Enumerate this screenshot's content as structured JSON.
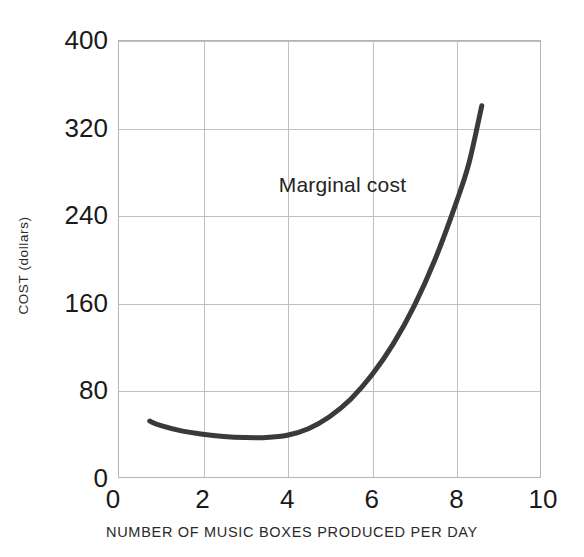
{
  "chart_data": {
    "type": "line",
    "title": "",
    "xlabel": "NUMBER OF MUSIC BOXES PRODUCED PER DAY",
    "ylabel": "COST (dollars)",
    "xlim": [
      0,
      10
    ],
    "ylim": [
      0,
      400
    ],
    "grid": true,
    "legend": "none",
    "xticks": [
      "0",
      "2",
      "4",
      "6",
      "8",
      "10"
    ],
    "xtick_values": [
      0,
      2,
      4,
      6,
      8,
      10
    ],
    "yticks": [
      "0",
      "80",
      "160",
      "240",
      "320",
      "400"
    ],
    "ytick_values": [
      0,
      80,
      160,
      240,
      320,
      400
    ],
    "annotations": [
      {
        "text": "Marginal cost",
        "x": 5.3,
        "y": 268
      }
    ],
    "series": [
      {
        "name": "Marginal cost",
        "color": "#3a3a3a",
        "linewidth": 5,
        "x": [
          0.75,
          1.0,
          1.5,
          2.0,
          2.5,
          3.0,
          3.5,
          4.0,
          4.5,
          5.0,
          5.5,
          6.0,
          6.5,
          7.0,
          7.5,
          8.0,
          8.3,
          8.6
        ],
        "y": [
          52,
          48,
          43,
          40,
          38,
          37,
          37,
          39,
          45,
          56,
          72,
          94,
          122,
          157,
          200,
          252,
          288,
          340
        ]
      }
    ]
  },
  "styling": {
    "curve_color": "#3a3a3a",
    "grid_color": "#c0c0c0",
    "frame_color": "#b5b5b5",
    "text_color": "#1a1a1a",
    "background": "#ffffff"
  }
}
